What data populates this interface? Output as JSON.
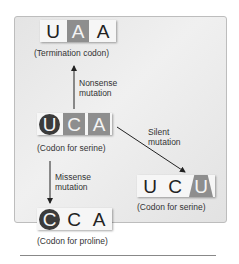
{
  "diagram": {
    "top_codon": {
      "letters": [
        "U",
        "A",
        "A"
      ],
      "caption": "(Termination codon)"
    },
    "center_codon": {
      "letters": [
        "U",
        "C",
        "A"
      ],
      "caption": "(Codon for serine)"
    },
    "right_codon": {
      "letters": [
        "U",
        "C",
        "U"
      ],
      "caption": "(Codon for serine)"
    },
    "bottom_codon": {
      "letters": [
        "C",
        "C",
        "A"
      ],
      "caption": "(Codon for proline)"
    },
    "mutations": {
      "nonsense": [
        "Nonsense",
        "mutation"
      ],
      "silent": [
        "Silent",
        "mutation"
      ],
      "missense": [
        "Missense",
        "mutation"
      ]
    },
    "colors": {
      "highlight_box": "#8e8e8e",
      "highlight_circle": "#3b3b3b",
      "panel": "#e8e8e8"
    }
  }
}
